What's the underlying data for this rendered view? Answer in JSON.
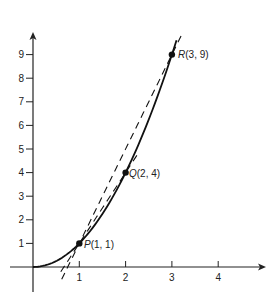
{
  "chart_data": {
    "type": "line",
    "title": "",
    "xlabel": "",
    "ylabel": "",
    "xlim": [
      -0.5,
      5.0
    ],
    "ylim": [
      -1.1,
      10.0
    ],
    "grid": false,
    "legend": null,
    "x_ticks": [
      1,
      2,
      3,
      4
    ],
    "y_ticks": [
      1,
      2,
      3,
      4,
      5,
      6,
      7,
      8,
      9
    ],
    "series": [
      {
        "name": "curve y = x^2",
        "style": "solid",
        "function": "x^2",
        "x_range": [
          0,
          3.1
        ]
      },
      {
        "name": "secant PR",
        "style": "dashed",
        "function": "4x - 3",
        "x_range": [
          0.62,
          3.2
        ]
      },
      {
        "name": "secant PQ",
        "style": "dashed",
        "function": "3x - 2",
        "x_range": [
          0.6,
          2.3
        ]
      }
    ],
    "points": [
      {
        "label": "P(1, 1)",
        "name": "P",
        "x": 1,
        "y": 1
      },
      {
        "label": "Q(2, 4)",
        "name": "Q",
        "x": 2,
        "y": 4
      },
      {
        "label": "R(3, 9)",
        "name": "R",
        "x": 3,
        "y": 9
      }
    ]
  },
  "labels": {
    "x_ticks": [
      "1",
      "2",
      "3",
      "4"
    ],
    "y_ticks": [
      "1",
      "2",
      "3",
      "4",
      "5",
      "6",
      "7",
      "8",
      "9"
    ],
    "P": {
      "letter": "P",
      "coords": "(1, 1)"
    },
    "Q": {
      "letter": "Q",
      "coords": "(2, 4)"
    },
    "R": {
      "letter": "R",
      "coords": "(3, 9)"
    }
  },
  "colors": {
    "ink": "#111111",
    "background": "#ffffff"
  }
}
